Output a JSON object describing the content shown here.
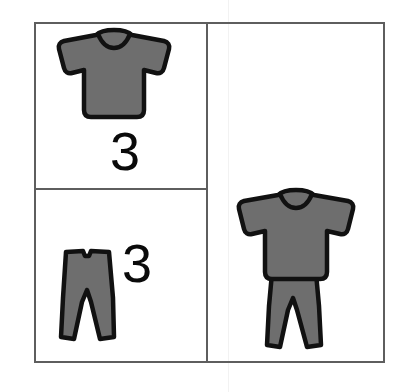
{
  "page": {
    "background_color": "#ffffff",
    "width": 403,
    "height": 392
  },
  "frame": {
    "border_color": "#5e5e5e",
    "border_width": 2,
    "fill_color": "#ffffff"
  },
  "style": {
    "garment_fill": "#6e6e6e",
    "garment_outline": "#111111",
    "number_color": "#0a0a0a",
    "divider_color": "#5e5e5e"
  },
  "cells": [
    {
      "id": "top-left",
      "name": "shirt-count-cell",
      "icon": "t-shirt-icon",
      "icon_label": "T-shirt",
      "count": "3",
      "count_position": "below-icon"
    },
    {
      "id": "bottom-left",
      "name": "pants-count-cell",
      "icon": "pants-icon",
      "icon_label": "Pants",
      "count": "3",
      "count_position": "right-of-icon"
    },
    {
      "id": "right",
      "name": "outfit-result-cell",
      "icon": "outfit-icon",
      "icon_label": "Outfit",
      "count": "",
      "count_position": "none"
    }
  ]
}
